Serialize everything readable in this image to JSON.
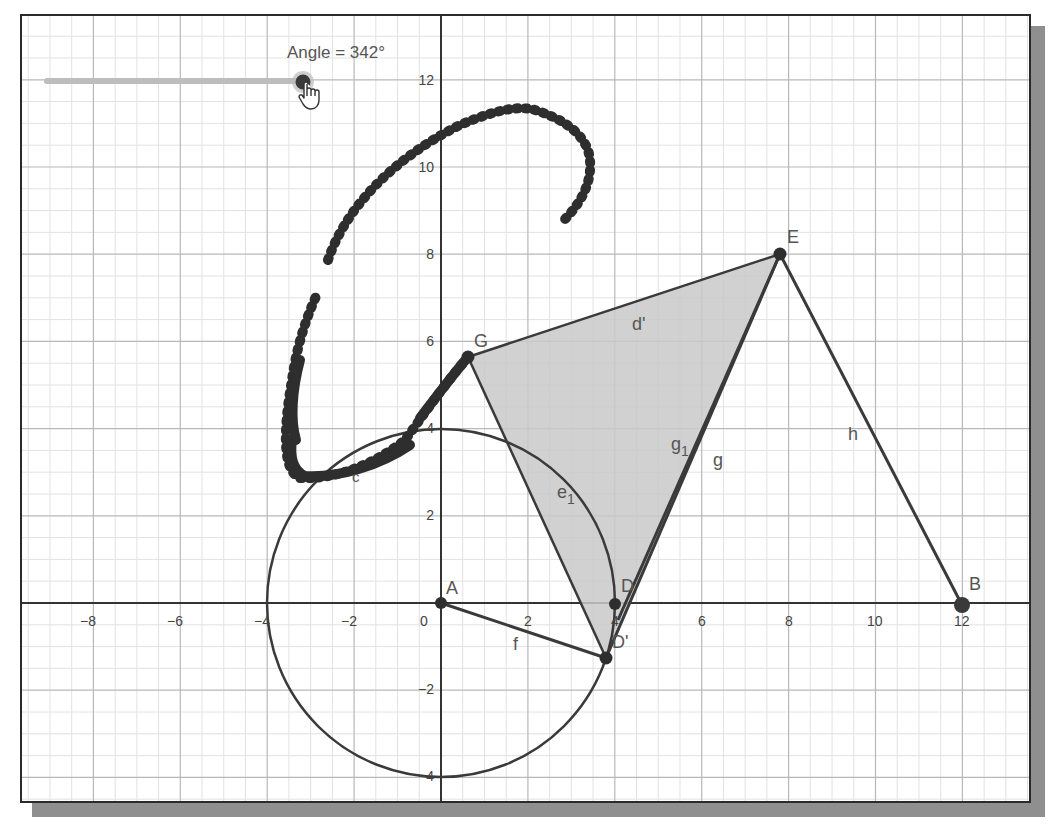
{
  "slider": {
    "label": "Angle = 342°",
    "value_deg": 342,
    "knob": {
      "x": 303,
      "y": 82
    },
    "track": {
      "x1": 47,
      "x2": 303,
      "y": 81
    }
  },
  "axes": {
    "x_ticks": [
      "−8",
      "−6",
      "−4",
      "−2",
      "0",
      "2",
      "4",
      "6",
      "8",
      "10",
      "12"
    ],
    "y_ticks": [
      "12",
      "10",
      "8",
      "6",
      "4",
      "2",
      "−2",
      "−4"
    ]
  },
  "points": {
    "A": {
      "label": "A",
      "x": 0,
      "y": 0
    },
    "B": {
      "label": "B",
      "x": 12,
      "y": 0
    },
    "D": {
      "label": "D",
      "x": 4,
      "y": 0
    },
    "D_prime": {
      "label": "D'",
      "x": 3.8,
      "y": -1.25
    },
    "E": {
      "label": "E",
      "x": 7.8,
      "y": 8
    },
    "G": {
      "label": "G",
      "x": 0.62,
      "y": 5.65
    }
  },
  "objects": {
    "circle_c": {
      "label": "c",
      "center": "A",
      "radius": 4
    },
    "segment_f": {
      "label": "f"
    },
    "segment_h": {
      "label": "h"
    },
    "segment_g": {
      "label": "g"
    },
    "segment_g1": {
      "label": "g",
      "subscript": "1"
    },
    "segment_d_prime": {
      "label": "d'"
    },
    "arc_e1": {
      "label": "e",
      "subscript": "1"
    },
    "trace_label": "c"
  },
  "colors": {
    "line": "#3a3a3a",
    "fill": "#c8c8c8",
    "grid_major": "#b5b5b5",
    "grid_minor": "#e0e0e0",
    "trace": "#2e2e2e"
  }
}
